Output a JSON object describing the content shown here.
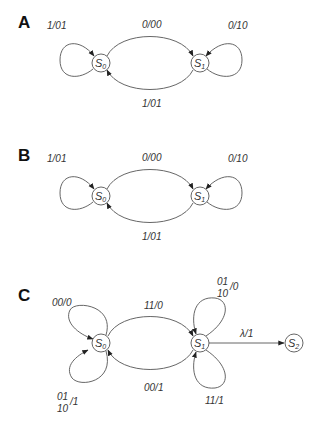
{
  "diagrams": [
    {
      "label": "A",
      "states": [
        {
          "name": "S",
          "sub": "0"
        },
        {
          "name": "S",
          "sub": "1"
        }
      ],
      "transitions": [
        {
          "from": "S0",
          "to": "S0",
          "label": "1/01"
        },
        {
          "from": "S0",
          "to": "S1",
          "label": "0/00"
        },
        {
          "from": "S1",
          "to": "S1",
          "label": "0/10"
        },
        {
          "from": "S1",
          "to": "S0",
          "label": "1/01"
        }
      ]
    },
    {
      "label": "B",
      "states": [
        {
          "name": "S",
          "sub": "0"
        },
        {
          "name": "S",
          "sub": "1"
        }
      ],
      "transitions": [
        {
          "from": "S0",
          "to": "S0",
          "label": "1/01"
        },
        {
          "from": "S0",
          "to": "S1",
          "label": "0/00"
        },
        {
          "from": "S1",
          "to": "S1",
          "label": "0/10"
        },
        {
          "from": "S1",
          "to": "S0",
          "label": "1/01"
        }
      ]
    },
    {
      "label": "C",
      "states": [
        {
          "name": "S",
          "sub": "0"
        },
        {
          "name": "S",
          "sub": "1"
        },
        {
          "name": "S",
          "sub": "2"
        }
      ],
      "transitions": [
        {
          "from": "S0",
          "to": "S0",
          "label": "00/0"
        },
        {
          "from": "S0",
          "to": "S0",
          "label_top": "01",
          "label_bottom": "10",
          "label_out": "/1"
        },
        {
          "from": "S0",
          "to": "S1",
          "label": "11/0"
        },
        {
          "from": "S1",
          "to": "S0",
          "label": "00/1"
        },
        {
          "from": "S1",
          "to": "S1",
          "label_top": "01",
          "label_bottom": "10",
          "label_out": "/0"
        },
        {
          "from": "S1",
          "to": "S1",
          "label": "11/1"
        },
        {
          "from": "S1",
          "to": "S2",
          "label": "λ/1"
        }
      ]
    }
  ]
}
